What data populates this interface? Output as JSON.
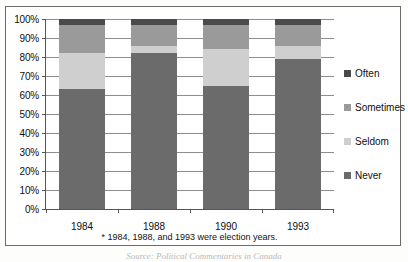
{
  "chart_data": {
    "type": "bar",
    "subtype": "stacked-100-percent",
    "title": "",
    "xlabel": "",
    "ylabel": "",
    "categories": [
      "1984",
      "1988",
      "1990",
      "1993"
    ],
    "ylim": [
      0,
      100
    ],
    "ytick_labels": [
      "0%",
      "10%",
      "20%",
      "30%",
      "40%",
      "50%",
      "60%",
      "70%",
      "80%",
      "90%",
      "100%"
    ],
    "ytick_values": [
      0,
      10,
      20,
      30,
      40,
      50,
      60,
      70,
      80,
      90,
      100
    ],
    "grid": true,
    "legend_position": "right",
    "stack_order_bottom_to_top": [
      "Never",
      "Seldom",
      "Sometimes",
      "Often"
    ],
    "series": [
      {
        "name": "Never",
        "color": "#6b6b6b",
        "values": [
          63,
          82,
          65,
          79
        ]
      },
      {
        "name": "Seldom",
        "color": "#cfcfcf",
        "values": [
          19,
          4,
          19,
          7
        ]
      },
      {
        "name": "Sometimes",
        "color": "#9a9a9a",
        "values": [
          15,
          11,
          13,
          11
        ]
      },
      {
        "name": "Often",
        "color": "#4a4a4a",
        "values": [
          3,
          3,
          3,
          3
        ]
      }
    ],
    "legend_entries": [
      {
        "label": "Often",
        "color": "#4a4a4a"
      },
      {
        "label": "Sometimes",
        "color": "#9a9a9a"
      },
      {
        "label": "Seldom",
        "color": "#cfcfcf"
      },
      {
        "label": "Never",
        "color": "#6b6b6b"
      }
    ],
    "annotations": [
      "* 1984, 1988, and 1993 were election years."
    ]
  },
  "footnote": "* 1984, 1988, and 1993 were election years.",
  "source_line": "Source: Political Commentaries in Canada"
}
